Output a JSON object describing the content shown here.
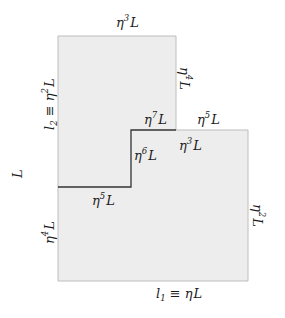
{
  "figure": {
    "type": "geometric-region-diagram",
    "colors": {
      "region_fill": "#ededed",
      "region_border": "#bdbdbd",
      "inner_boundary": "#333333",
      "text": "#1a1a1a"
    },
    "region_polygon": [
      [
        58,
        36
      ],
      [
        176,
        36
      ],
      [
        176,
        130
      ],
      [
        248,
        130
      ],
      [
        248,
        281
      ],
      [
        58,
        281
      ]
    ],
    "inner_boundary_path": [
      [
        58,
        187
      ],
      [
        131,
        187
      ],
      [
        131,
        130
      ],
      [
        176,
        130
      ]
    ]
  },
  "labels": {
    "top_edge": {
      "base": "η",
      "exp": "3",
      "suffix": "L"
    },
    "upper_right_edge": {
      "base": "η",
      "exp": "4",
      "suffix": "L"
    },
    "left_upper": {
      "prefix": "l",
      "sub": "2",
      "rel": " ≡ ",
      "base": "η",
      "exp": "2",
      "suffix": "L"
    },
    "left_total": {
      "text": "L"
    },
    "step_top_left": {
      "base": "η",
      "exp": "7",
      "suffix": "L"
    },
    "step_top_right": {
      "base": "η",
      "exp": "5",
      "suffix": "L"
    },
    "step_inner_vertical": {
      "base": "η",
      "exp": "6",
      "suffix": "L"
    },
    "step_inner_right": {
      "base": "η",
      "exp": "3",
      "suffix": "L"
    },
    "step_bottom": {
      "base": "η",
      "exp": "5",
      "suffix": "L"
    },
    "left_lower": {
      "base": "η",
      "exp": "4",
      "suffix": "L"
    },
    "right_lower": {
      "base": "η",
      "exp": "2",
      "suffix": "L"
    },
    "bottom_edge": {
      "prefix": "l",
      "sub": "1",
      "rel": " ≡ ",
      "base": "η",
      "suffix": "L"
    }
  }
}
